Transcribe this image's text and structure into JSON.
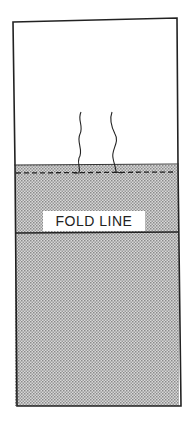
{
  "diagram": {
    "fold_label": "FOLD LINE",
    "colors": {
      "outline": "#222222",
      "shading": "#bdbdbd",
      "background": "#ffffff"
    }
  }
}
